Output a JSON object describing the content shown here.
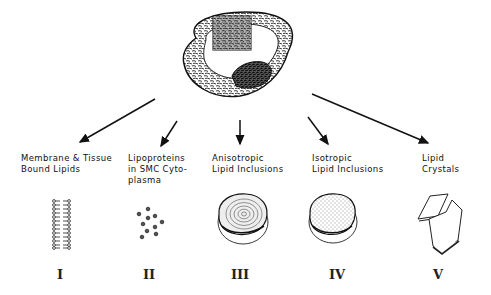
{
  "diagram": {
    "source": {
      "name": "arterial-cross-section",
      "description": "Cross-section of artery with atherosclerotic plaque and magnified inset"
    },
    "categories": [
      {
        "numeral": "I",
        "label_lines": [
          "Membrane & Tissue",
          "Bound  Lipids"
        ],
        "illustration": "lipid-bilayer"
      },
      {
        "numeral": "II",
        "label_lines": [
          "Lipoproteins",
          "in SMC Cyto-",
          "plasma"
        ],
        "illustration": "scattered-particles"
      },
      {
        "numeral": "III",
        "label_lines": [
          "Anisotropic",
          "Lipid Inclusions"
        ],
        "illustration": "concentric-droplet"
      },
      {
        "numeral": "IV",
        "label_lines": [
          "Isotropic",
          "Lipid Inclusions"
        ],
        "illustration": "stippled-droplet"
      },
      {
        "numeral": "V",
        "label_lines": [
          "Lipid",
          "Crystals"
        ],
        "illustration": "plate-crystals"
      }
    ],
    "colors": {
      "ink": "#111111",
      "background": "#ffffff"
    }
  }
}
